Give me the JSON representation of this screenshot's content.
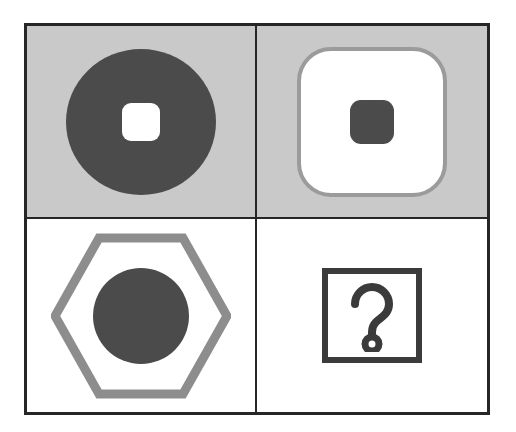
{
  "puzzle": {
    "kind": "shape-matrix-2x2",
    "title": "Shape analogy matrix",
    "grid": {
      "rows": 2,
      "columns": 2
    },
    "frame": {
      "border_color": "#262626",
      "border_width_px": 3,
      "divider_width_px": 2
    },
    "palette": {
      "background_gray": "#c9c9c9",
      "background_white": "#ffffff",
      "shape_dark": "#4b4b4b",
      "shape_mid_gray": "#9b9b9b",
      "outline_black": "#3b3b3b",
      "frame_black": "#262626"
    },
    "cells": [
      {
        "position": "top-left",
        "background": "#c9c9c9",
        "outer_shape": "circle",
        "outer_fill": "#4b4b4b",
        "outer_style": "filled",
        "inner_shape": "rounded-square",
        "inner_fill": "#ffffff",
        "inner_style": "filled",
        "description": "dark gray filled circle containing a small white rounded square"
      },
      {
        "position": "top-right",
        "background": "#c9c9c9",
        "outer_shape": "rounded-square",
        "outer_fill": "#ffffff",
        "outer_stroke": "#9b9b9b",
        "outer_style": "outlined-filled",
        "inner_shape": "rounded-square",
        "inner_fill": "#4b4b4b",
        "inner_style": "filled",
        "description": "white rounded square with gray border containing a small dark gray rounded square"
      },
      {
        "position": "bottom-left",
        "background": "#ffffff",
        "outer_shape": "hexagon",
        "outer_stroke": "#8d8d8d",
        "outer_style": "outlined",
        "inner_shape": "circle",
        "inner_fill": "#4b4b4b",
        "inner_style": "filled",
        "description": "gray hexagon outline containing a dark gray filled circle"
      },
      {
        "position": "bottom-right",
        "background": "#ffffff",
        "outer_shape": "square",
        "outer_stroke": "#3b3b3b",
        "outer_style": "outlined",
        "inner_shape": "question-mark",
        "inner_style": "outlined",
        "inner_glyph": "?",
        "is_answer_slot": true,
        "description": "dark square outline containing an outlined question mark marking the missing answer"
      }
    ]
  }
}
